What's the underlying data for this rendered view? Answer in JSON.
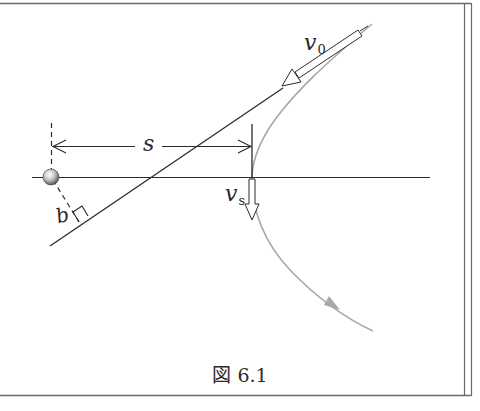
{
  "figure": {
    "caption": "図 6.1",
    "labels": {
      "v0_symbol": "v",
      "v0_subscript": "0",
      "vs_symbol": "v",
      "vs_subscript": "s",
      "s": "s",
      "b": "b"
    },
    "elements": {
      "target": "target-sphere",
      "axis": "horizontal-axis",
      "asymptote": "incoming-asymptote-line",
      "trajectory": "hyperbolic-trajectory",
      "v0_arrow": "initial-velocity-arrow",
      "vs_arrow": "periapsis-velocity-arrow",
      "s_dimension": "periapsis-distance",
      "b_dimension": "impact-parameter"
    },
    "colors": {
      "line": "#2a2a2a",
      "trajectory": "#a8a8a8",
      "border": "#6a6a6a",
      "background": "#ffffff"
    }
  }
}
